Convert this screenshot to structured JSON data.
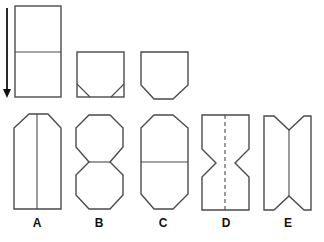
{
  "diagram": {
    "type": "paper-folding-puzzle",
    "steps": [
      {
        "id": "step-1",
        "description": "tall rectangle with horizontal fold line, arrow indicating fold downward"
      },
      {
        "id": "step-2",
        "description": "folded square with two bottom corner creases"
      },
      {
        "id": "step-3",
        "description": "square with bottom corners cut off"
      }
    ],
    "answer_options": [
      {
        "label": "A",
        "description": "tall shape with top corners cut, vertical center line"
      },
      {
        "label": "B",
        "description": "two octagons joined"
      },
      {
        "label": "C",
        "description": "elongated octagon with horizontal center line"
      },
      {
        "label": "D",
        "description": "rectangle with V notches on both sides, dashed vertical line"
      },
      {
        "label": "E",
        "description": "rectangle with V notches at top and bottom, vertical center line"
      }
    ],
    "stroke_color": "#4a4a4a",
    "background_color": "#ffffff"
  }
}
